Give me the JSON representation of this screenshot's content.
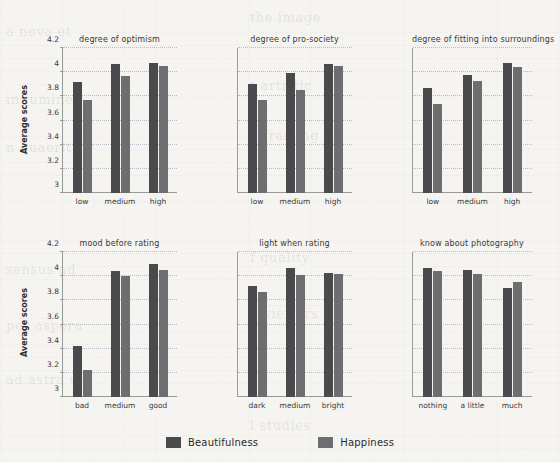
{
  "chart_data": {
    "type": "bar",
    "title": "",
    "ylabel": "Average scores",
    "xlabel": "",
    "ylim": [
      3,
      4.2
    ],
    "yticks": [
      "3",
      "3.2",
      "3.4",
      "3.6",
      "3.8",
      "4",
      "4.2"
    ],
    "ytick_values": [
      3,
      3.2,
      3.4,
      3.6,
      3.8,
      4,
      4.2
    ],
    "grid": true,
    "legend_position": "bottom",
    "series_names": [
      "Beautifulness",
      "Happiness"
    ],
    "series_colors": [
      "#4a4a4c",
      "#6e6e70"
    ],
    "panels": [
      {
        "title": "degree of optimism",
        "categories": [
          "low",
          "medium",
          "high"
        ],
        "series": [
          {
            "name": "Beautifulness",
            "values": [
              3.92,
              4.07,
              4.08
            ]
          },
          {
            "name": "Happiness",
            "values": [
              3.77,
              3.97,
              4.05
            ]
          }
        ]
      },
      {
        "title": "degree of pro-society",
        "categories": [
          "low",
          "medium",
          "high"
        ],
        "series": [
          {
            "name": "Beautifulness",
            "values": [
              3.9,
              3.99,
              4.07
            ]
          },
          {
            "name": "Happiness",
            "values": [
              3.77,
              3.85,
              4.05
            ]
          }
        ]
      },
      {
        "title": "degree of fitting into surroundings",
        "categories": [
          "low",
          "medium",
          "high"
        ],
        "series": [
          {
            "name": "Beautifulness",
            "values": [
              3.87,
              3.98,
              4.08
            ]
          },
          {
            "name": "Happiness",
            "values": [
              3.74,
              3.93,
              4.04
            ]
          }
        ]
      },
      {
        "title": "mood before rating",
        "categories": [
          "bad",
          "medium",
          "good"
        ],
        "series": [
          {
            "name": "Beautifulness",
            "values": [
              3.42,
              4.04,
              4.1
            ]
          },
          {
            "name": "Happiness",
            "values": [
              3.22,
              4.0,
              4.05
            ]
          }
        ]
      },
      {
        "title": "light when rating",
        "categories": [
          "dark",
          "medium",
          "bright"
        ],
        "series": [
          {
            "name": "Beautifulness",
            "values": [
              3.92,
              4.07,
              4.03
            ]
          },
          {
            "name": "Happiness",
            "values": [
              3.87,
              4.01,
              4.02
            ]
          }
        ]
      },
      {
        "title": "know about photography",
        "categories": [
          "nothing",
          "a little",
          "much"
        ],
        "series": [
          {
            "name": "Beautifulness",
            "values": [
              4.07,
              4.05,
              3.9
            ]
          },
          {
            "name": "Happiness",
            "values": [
              4.04,
              4.02,
              3.95
            ]
          }
        ]
      }
    ]
  },
  "legend": {
    "items": [
      {
        "label": "Beautifulness",
        "color": "#4a4a4c"
      },
      {
        "label": "Happiness",
        "color": "#6e6e70"
      }
    ]
  },
  "axis": {
    "ylabel_top": "Average scores",
    "ylabel_bottom": "Average scores"
  },
  "background_ghost_text": [
    "a nova et",
    "the image",
    "in lumine",
    "t artistic",
    "n quaerit",
    "e framing",
    "sensus ad",
    "f quality",
    "per aspera",
    "d viewers",
    "ad astra ut",
    "l studies"
  ]
}
